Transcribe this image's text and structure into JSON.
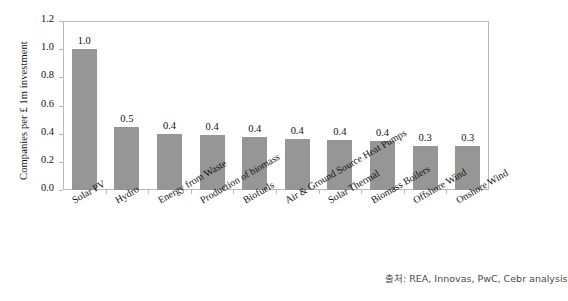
{
  "chart_data": {
    "type": "bar",
    "title": "",
    "xlabel": "",
    "ylabel": "Companies per £ 1m investment",
    "ylim": [
      0,
      1.2
    ],
    "ytick_labels": [
      "0.0",
      "0.2",
      "0.4",
      "0.6",
      "0.8",
      "1.0",
      "1.2"
    ],
    "ytick_values": [
      0,
      0.2,
      0.4,
      0.6,
      0.8,
      1.0,
      1.2
    ],
    "grid": false,
    "legend": "none",
    "bar_color": "#969696",
    "categories": [
      "Solar PV",
      "Hydro",
      "Energy from Waste",
      "Production of biomass",
      "Biofuels",
      "Air & Ground Source Heat Pumps",
      "Solar Thermal",
      "Biomass Boilers",
      "Offshore Wind",
      "Onshore Wind"
    ],
    "values": [
      1.0,
      0.45,
      0.4,
      0.39,
      0.375,
      0.36,
      0.355,
      0.35,
      0.315,
      0.31
    ],
    "data_labels": [
      "1.0",
      "0.5",
      "0.4",
      "0.4",
      "0.4",
      "0.4",
      "0.4",
      "0.4",
      "0.3",
      "0.3"
    ]
  },
  "footer": {
    "source": "출처: REA, Innovas, PwC, Cebr analysis"
  }
}
